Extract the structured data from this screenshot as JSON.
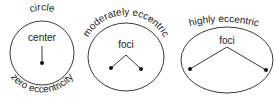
{
  "colors": {
    "stroke": "#222222",
    "background": "#ffffff"
  },
  "diagrams": [
    {
      "shape": "circle",
      "top_label": "circle",
      "inner_label": "center",
      "bottom_label": "zero eccentricity"
    },
    {
      "shape": "ellipse",
      "top_label": "moderately eccentric",
      "inner_label": "foci"
    },
    {
      "shape": "ellipse",
      "top_label": "highly eccentric",
      "inner_label": "foci"
    }
  ]
}
